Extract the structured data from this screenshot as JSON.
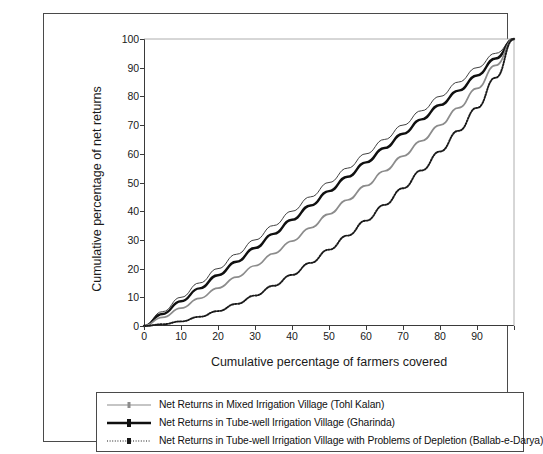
{
  "chart_data": {
    "type": "line",
    "title": "",
    "xlabel": "Cumulative percentage of farmers covered",
    "ylabel": "Cumulative percentage of net returns",
    "xlim": [
      0,
      100
    ],
    "ylim": [
      0,
      100
    ],
    "xticks": [
      0,
      10,
      20,
      30,
      40,
      50,
      60,
      70,
      80,
      90
    ],
    "yticks": [
      0,
      10,
      20,
      30,
      40,
      50,
      60,
      70,
      80,
      90,
      100
    ],
    "grid": false,
    "legend_position": "below-plot",
    "x": [
      0,
      5,
      10,
      15,
      20,
      25,
      30,
      35,
      40,
      45,
      50,
      55,
      60,
      65,
      70,
      75,
      80,
      85,
      90,
      95,
      100
    ],
    "series": [
      {
        "name": "Line of equality",
        "style": "thin-solid",
        "color": "#2b2b2b",
        "in_legend": false,
        "values": [
          0,
          5,
          10,
          15,
          20,
          25,
          30,
          35,
          40,
          45,
          50,
          55,
          60,
          65,
          70,
          75,
          80,
          85,
          90,
          95,
          100
        ]
      },
      {
        "name": "Net Returns in Tube-well Irrigation Village (Gharinda)",
        "style": "thick-solid",
        "color": "#101010",
        "in_legend": true,
        "values": [
          0,
          4.2,
          8.6,
          13.1,
          17.7,
          22.4,
          27.2,
          32.1,
          37.0,
          42.0,
          47.0,
          52.0,
          57.0,
          62.0,
          67.0,
          72.0,
          77.0,
          82.0,
          87.3,
          93.2,
          100
        ]
      },
      {
        "name": "Net Returns in Mixed Irrigation Village (Tohl Kalan)",
        "style": "thin-gray-solid",
        "color": "#8c8c8c",
        "in_legend": true,
        "values": [
          0,
          3.0,
          6.2,
          9.6,
          13.2,
          17.0,
          21.0,
          25.2,
          29.6,
          34.2,
          39.0,
          43.9,
          48.9,
          54.0,
          59.2,
          64.5,
          70.0,
          76.0,
          82.8,
          90.8,
          100
        ]
      },
      {
        "name": "Net Returns in Tube-well Irrigation Village with Problems of Depletion (Ballab-e-Darya)",
        "style": "dotted",
        "color": "#1a1a1a",
        "in_legend": true,
        "values": [
          0,
          0.6,
          1.6,
          3.2,
          5.2,
          7.7,
          10.6,
          14.0,
          17.8,
          22.0,
          26.6,
          31.5,
          36.7,
          42.2,
          48.0,
          54.2,
          60.8,
          68.0,
          76.0,
          86.5,
          100
        ]
      }
    ]
  },
  "axes": {
    "y_title": "Cumulative percentage of net returns",
    "x_title": "Cumulative percentage of farmers covered",
    "y_tick_labels": [
      "0",
      "10",
      "20",
      "30",
      "40",
      "50",
      "60",
      "70",
      "80",
      "90",
      "100"
    ],
    "x_tick_labels": [
      "0",
      "10",
      "20",
      "30",
      "40",
      "50",
      "60",
      "70",
      "80",
      "90"
    ]
  },
  "legend": {
    "items": [
      {
        "label": "Net Returns in Mixed Irrigation Village (Tohl Kalan)",
        "marker": "gray-line-with-dot",
        "color": "#8c8c8c"
      },
      {
        "label": "Net Returns in Tube-well Irrigation Village (Gharinda)",
        "marker": "thick-black-line-with-dot",
        "color": "#101010"
      },
      {
        "label": "Net Returns in Tube-well Irrigation Village with Problems of Depletion (Ballab-e-Darya)",
        "marker": "dotted-line-with-dot",
        "color": "#1a1a1a"
      }
    ]
  }
}
